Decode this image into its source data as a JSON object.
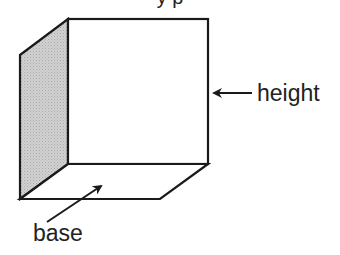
{
  "diagram": {
    "title_partial": "y p",
    "shape": "open box / rectangular prism with one shaded side face",
    "labels": {
      "height": "height",
      "base": "base"
    },
    "colors": {
      "stroke": "#1a1a1a",
      "shaded_face": "#c8c8c8",
      "background": "#ffffff",
      "text": "#222222"
    }
  }
}
